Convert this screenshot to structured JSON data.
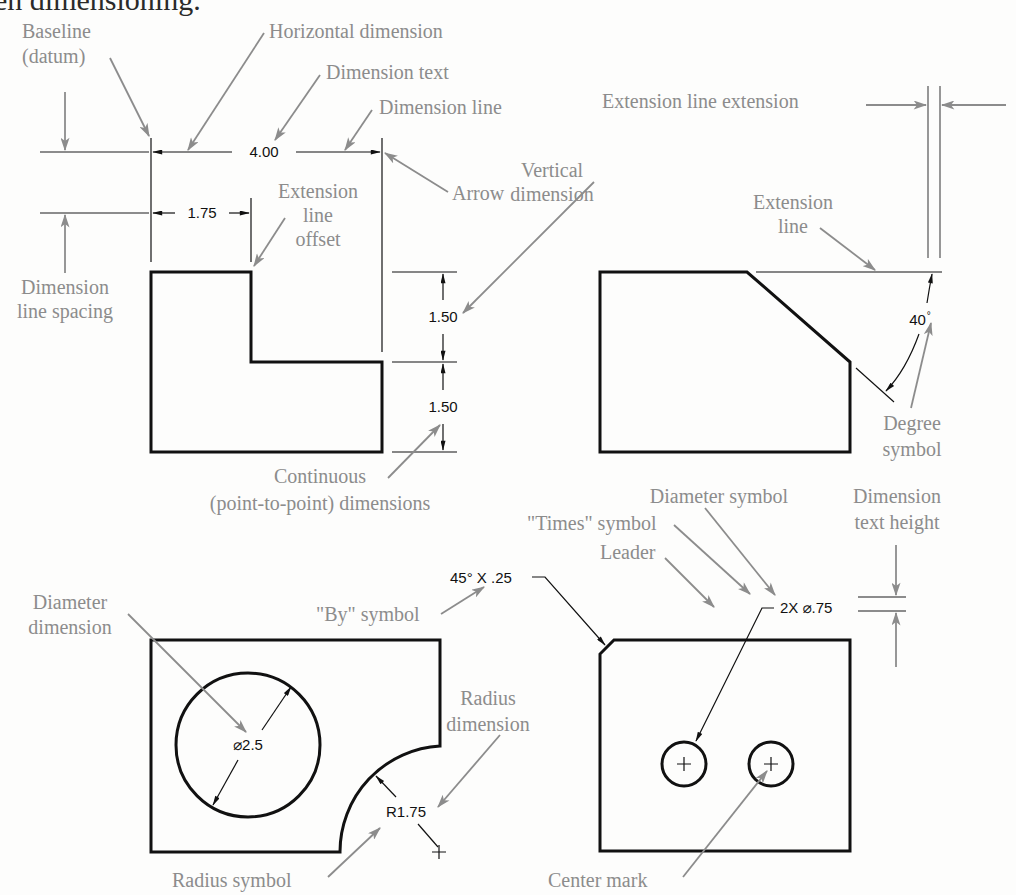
{
  "title_fragment": "en dimensioning.",
  "colors": {
    "label": "#8c8c8c",
    "object_line": "#111111",
    "background": "#fdfdfc"
  },
  "figure_top_left": {
    "labels": {
      "baseline": [
        "Baseline",
        "(datum)"
      ],
      "horizontal_dimension": "Horizontal dimension",
      "dimension_text": "Dimension text",
      "dimension_line": "Dimension line",
      "arrow": "Arrow",
      "extension_line_offset": [
        "Extension",
        "line",
        "offset"
      ],
      "dimension_line_spacing": [
        "Dimension",
        "line spacing"
      ],
      "vertical_dimension": [
        "Vertical",
        "dimension"
      ],
      "continuous": [
        "Continuous",
        "(point-to-point) dimensions"
      ]
    },
    "dimensions": {
      "overall_width": "4.00",
      "step_width": "1.75",
      "upper_height": "1.50",
      "lower_height": "1.50"
    }
  },
  "figure_top_right": {
    "labels": {
      "extension_line_extension": "Extension line extension",
      "extension_line": [
        "Extension",
        "line"
      ],
      "degree_symbol": [
        "Degree",
        "symbol"
      ]
    },
    "dimensions": {
      "angle": "40",
      "degree_mark": "°"
    }
  },
  "figure_bottom_left": {
    "labels": {
      "diameter_dimension": [
        "Diameter",
        "dimension"
      ],
      "by_symbol": "\"By\" symbol",
      "radius_dimension": [
        "Radius",
        "dimension"
      ],
      "radius_symbol": "Radius symbol"
    },
    "dimensions": {
      "diameter": "⌀2.5",
      "radius": "R1.75",
      "chamfer": "45° X .25"
    }
  },
  "figure_bottom_right": {
    "labels": {
      "times_symbol": "\"Times\" symbol",
      "diameter_symbol": "Diameter symbol",
      "leader": "Leader",
      "dimension_text_height": [
        "Dimension",
        "text height"
      ],
      "center_mark": "Center mark"
    },
    "dimensions": {
      "holes": "2X ⌀.75"
    }
  }
}
